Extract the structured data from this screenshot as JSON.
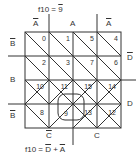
{
  "title_top": {
    "prefix": "f10 = ",
    "var": "9"
  },
  "title_bottom": {
    "prefix": "f10 = ",
    "term1": "D",
    "plus": " + ",
    "term2": "A"
  },
  "column_labels": [
    {
      "text": "A",
      "negated": true
    },
    {
      "text": "A",
      "negated": false
    },
    {
      "text": "A",
      "negated": true
    }
  ],
  "row_labels_left": [
    {
      "text": "B",
      "negated": true
    },
    {
      "text": "B",
      "negated": false
    },
    {
      "text": "B",
      "negated": true
    }
  ],
  "row_labels_right": [
    {
      "text": "D",
      "negated": true
    },
    {
      "text": "D",
      "negated": false
    }
  ],
  "bottom_labels": [
    {
      "text": "C",
      "negated": true
    },
    {
      "text": "C",
      "negated": false
    }
  ],
  "cells": [
    [
      "0",
      "1",
      "5",
      "4"
    ],
    [
      "2",
      "3",
      "7",
      "6"
    ],
    [
      "10",
      "11",
      "15",
      "14"
    ],
    [
      "8",
      "9",
      "13",
      "12"
    ]
  ],
  "highlighted_cell": "9"
}
